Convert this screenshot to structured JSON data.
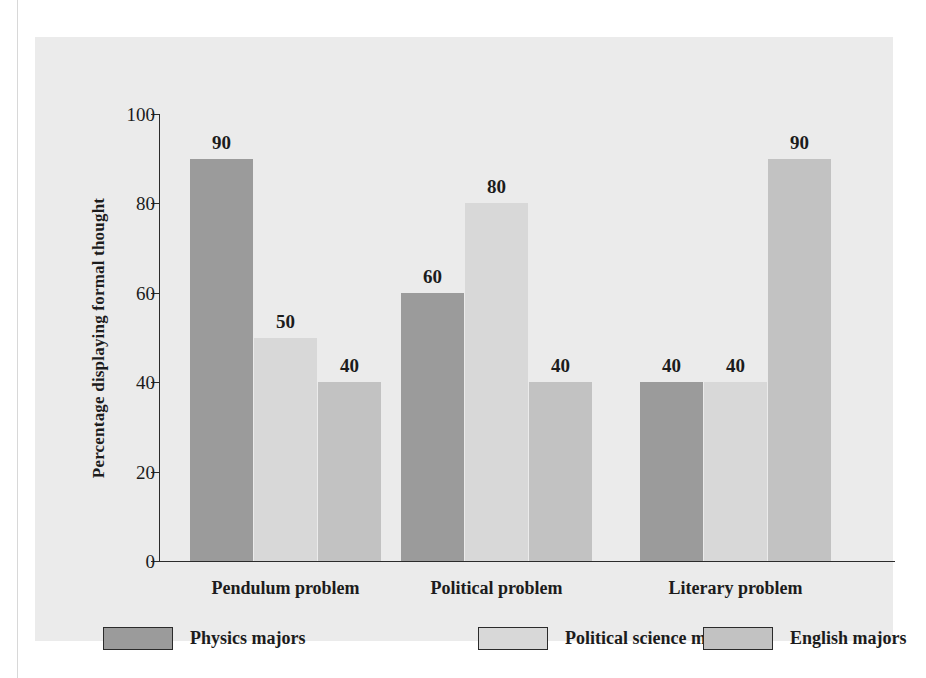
{
  "chart_data": {
    "type": "bar",
    "title": "",
    "xlabel": "",
    "ylabel": "Percentage displaying formal thought",
    "ylim": [
      0,
      100
    ],
    "ytick_values": [
      0,
      20,
      40,
      60,
      80,
      100
    ],
    "ytick_labels": [
      "0",
      "20",
      "40",
      "60",
      "80",
      "100"
    ],
    "grid": false,
    "legend_position": "bottom",
    "categories": [
      "Pendulum problem",
      "Political problem",
      "Literary problem"
    ],
    "series": [
      {
        "name": "Physics majors",
        "color": "#9b9b9b",
        "values": [
          90,
          60,
          40
        ],
        "value_labels": [
          "90",
          "60",
          "40"
        ]
      },
      {
        "name": "Political science majors",
        "color": "#d8d8d8",
        "values": [
          50,
          80,
          40
        ],
        "value_labels": [
          "50",
          "80",
          "40"
        ]
      },
      {
        "name": "English majors",
        "color": "#c2c2c2",
        "values": [
          40,
          40,
          90
        ],
        "value_labels": [
          "40",
          "40",
          "90"
        ]
      }
    ]
  },
  "figure": {
    "panel_color": "#ebebeb",
    "axis_color": "#2b2b2b",
    "text_color": "#1c1c1c"
  }
}
